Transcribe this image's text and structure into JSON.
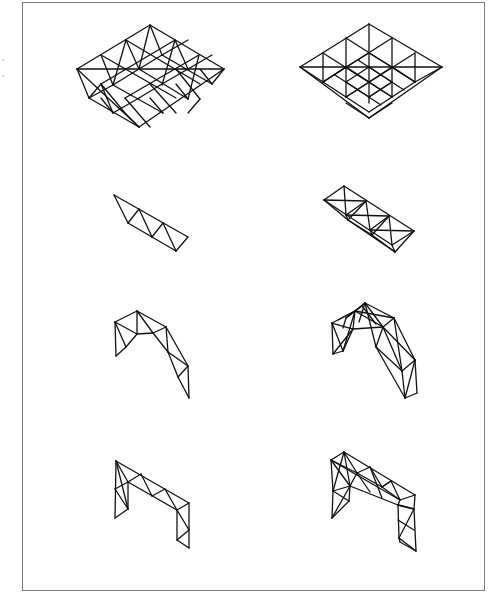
{
  "figure": {
    "background": "#ffffff",
    "frame_color": "#7a7a7a",
    "line_color": "#111111"
  },
  "structures": [
    {
      "name": "grid-plate-left",
      "label": "double-layer space grid (triangular)",
      "lines": [
        [
          150,
          25,
          77,
          69
        ],
        [
          150,
          25,
          224,
          69
        ],
        [
          77,
          69,
          139,
          127
        ],
        [
          224,
          69,
          139,
          127
        ],
        [
          77,
          69,
          224,
          69
        ],
        [
          126,
          40,
          200,
          84
        ],
        [
          101,
          55,
          176,
          98
        ],
        [
          175,
          40,
          101,
          84
        ],
        [
          199,
          55,
          125,
          98
        ],
        [
          126,
          40,
          113,
          85
        ],
        [
          150,
          25,
          139,
          69
        ],
        [
          175,
          40,
          162,
          85
        ],
        [
          199,
          55,
          188,
          99
        ],
        [
          101,
          55,
          113,
          85
        ],
        [
          126,
          40,
          139,
          69
        ],
        [
          150,
          25,
          162,
          55
        ],
        [
          175,
          40,
          188,
          69
        ],
        [
          89,
          98,
          113,
          85
        ],
        [
          113,
          85,
          139,
          69
        ],
        [
          139,
          69,
          162,
          55
        ],
        [
          162,
          55,
          188,
          40
        ],
        [
          113,
          113,
          139,
          98
        ],
        [
          139,
          98,
          162,
          84
        ],
        [
          162,
          84,
          188,
          69
        ],
        [
          188,
          69,
          212,
          55
        ],
        [
          89,
          98,
          139,
          127
        ],
        [
          113,
          85,
          163,
          113
        ],
        [
          139,
          69,
          188,
          99
        ],
        [
          162,
          55,
          212,
          84
        ],
        [
          89,
          98,
          101,
          84
        ],
        [
          113,
          113,
          101,
          98
        ],
        [
          139,
          127,
          125,
          113
        ],
        [
          163,
          113,
          150,
          98
        ],
        [
          188,
          99,
          176,
          84
        ],
        [
          212,
          84,
          200,
          69
        ],
        [
          101,
          84,
          125,
          113
        ],
        [
          125,
          98,
          150,
          127
        ],
        [
          150,
          84,
          176,
          113
        ],
        [
          176,
          69,
          200,
          99
        ],
        [
          77,
          69,
          89,
          98
        ],
        [
          224,
          69,
          212,
          84
        ],
        [
          101,
          84,
          113,
          113
        ],
        [
          200,
          99,
          188,
          113
        ]
      ]
    },
    {
      "name": "grid-plate-right",
      "label": "double-layer space grid (square-on-diagonal)",
      "lines": [
        [
          369,
          24,
          300,
          67
        ],
        [
          369,
          24,
          442,
          67
        ],
        [
          300,
          67,
          369,
          118
        ],
        [
          442,
          67,
          369,
          118
        ],
        [
          300,
          67,
          442,
          67
        ],
        [
          346,
          38,
          415,
          82
        ],
        [
          323,
          53,
          392,
          97
        ],
        [
          392,
          38,
          323,
          82
        ],
        [
          415,
          53,
          346,
          97
        ],
        [
          369,
          24,
          369,
          67
        ],
        [
          346,
          38,
          346,
          82
        ],
        [
          392,
          38,
          392,
          82
        ],
        [
          323,
          53,
          323,
          82
        ],
        [
          415,
          53,
          415,
          82
        ],
        [
          346,
          82,
          346,
          97
        ],
        [
          392,
          82,
          392,
          97
        ],
        [
          369,
          67,
          369,
          103
        ],
        [
          323,
          82,
          346,
          67
        ],
        [
          346,
          67,
          369,
          53
        ],
        [
          369,
          53,
          392,
          67
        ],
        [
          392,
          67,
          415,
          82
        ],
        [
          323,
          82,
          346,
          97
        ],
        [
          346,
          97,
          369,
          112
        ],
        [
          369,
          112,
          392,
          97
        ],
        [
          392,
          97,
          415,
          82
        ],
        [
          346,
          67,
          369,
          82
        ],
        [
          369,
          82,
          392,
          67
        ],
        [
          346,
          82,
          369,
          97
        ],
        [
          369,
          97,
          392,
          82
        ],
        [
          300,
          67,
          323,
          82
        ],
        [
          442,
          67,
          415,
          82
        ],
        [
          369,
          118,
          346,
          103
        ],
        [
          369,
          118,
          392,
          103
        ],
        [
          323,
          82,
          346,
          67
        ],
        [
          415,
          82,
          392,
          67
        ],
        [
          346,
          67,
          369,
          82
        ],
        [
          346,
          82,
          369,
          67
        ],
        [
          369,
          82,
          392,
          97
        ],
        [
          369,
          67,
          392,
          82
        ],
        [
          346,
          97,
          369,
          82
        ],
        [
          392,
          82,
          369,
          97
        ],
        [
          335,
          75,
          358,
          90
        ],
        [
          381,
          75,
          404,
          90
        ],
        [
          358,
          60,
          381,
          75
        ],
        [
          358,
          90,
          381,
          105
        ]
      ]
    },
    {
      "name": "planar-truss-left",
      "label": "planar Warren truss",
      "lines": [
        [
          114,
          195,
          188,
          237
        ],
        [
          128,
          223,
          176,
          251
        ],
        [
          176,
          251,
          188,
          237
        ],
        [
          114,
          195,
          128,
          223
        ],
        [
          128,
          223,
          139,
          209
        ],
        [
          139,
          209,
          152,
          237
        ],
        [
          152,
          237,
          163,
          223
        ],
        [
          163,
          223,
          176,
          251
        ]
      ]
    },
    {
      "name": "box-truss-right",
      "label": "triangular box truss",
      "lines": [
        [
          344,
          186,
          324,
          200
        ],
        [
          344,
          186,
          414,
          231
        ],
        [
          324,
          200,
          392,
          245
        ],
        [
          414,
          231,
          392,
          245
        ],
        [
          344,
          186,
          346,
          215
        ],
        [
          324,
          200,
          366,
          201
        ],
        [
          366,
          201,
          346,
          215
        ],
        [
          366,
          201,
          370,
          230
        ],
        [
          346,
          215,
          389,
          216
        ],
        [
          389,
          216,
          370,
          230
        ],
        [
          389,
          216,
          392,
          245
        ],
        [
          370,
          230,
          414,
          231
        ],
        [
          324,
          200,
          348,
          220
        ],
        [
          348,
          220,
          395,
          252
        ],
        [
          392,
          245,
          395,
          252
        ],
        [
          414,
          231,
          395,
          252
        ],
        [
          346,
          215,
          348,
          220
        ],
        [
          370,
          230,
          372,
          235
        ],
        [
          348,
          220,
          372,
          235
        ],
        [
          372,
          235,
          395,
          252
        ],
        [
          348,
          220,
          366,
          201
        ],
        [
          372,
          235,
          389,
          216
        ]
      ]
    },
    {
      "name": "arch-truss-left",
      "label": "planar arch truss",
      "lines": [
        [
          115,
          322,
          137,
          311
        ],
        [
          137,
          311,
          166,
          327
        ],
        [
          166,
          327,
          188,
          366
        ],
        [
          188,
          366,
          189,
          398
        ],
        [
          115,
          322,
          116,
          356
        ],
        [
          116,
          356,
          126,
          347
        ],
        [
          126,
          347,
          137,
          334
        ],
        [
          137,
          334,
          153,
          333
        ],
        [
          153,
          333,
          166,
          327
        ],
        [
          153,
          333,
          168,
          352
        ],
        [
          168,
          352,
          178,
          377
        ],
        [
          178,
          377,
          189,
          398
        ],
        [
          115,
          322,
          126,
          347
        ],
        [
          115,
          322,
          137,
          334
        ],
        [
          137,
          311,
          137,
          334
        ],
        [
          137,
          311,
          153,
          333
        ],
        [
          166,
          327,
          168,
          352
        ],
        [
          168,
          352,
          188,
          366
        ],
        [
          188,
          366,
          178,
          377
        ]
      ]
    },
    {
      "name": "arch-truss-right",
      "label": "spatial arch truss",
      "lines": [
        [
          332,
          323,
          355,
          311
        ],
        [
          355,
          311,
          365,
          303
        ],
        [
          365,
          303,
          394,
          318
        ],
        [
          355,
          311,
          383,
          327
        ],
        [
          394,
          318,
          415,
          360
        ],
        [
          383,
          327,
          402,
          371
        ],
        [
          415,
          360,
          417,
          393
        ],
        [
          402,
          371,
          405,
          398
        ],
        [
          405,
          398,
          417,
          393
        ],
        [
          402,
          371,
          415,
          360
        ],
        [
          332,
          323,
          333,
          354
        ],
        [
          333,
          354,
          343,
          351
        ],
        [
          343,
          351,
          353,
          329
        ],
        [
          353,
          329,
          383,
          327
        ],
        [
          332,
          323,
          353,
          329
        ],
        [
          355,
          311,
          353,
          329
        ],
        [
          365,
          303,
          383,
          327
        ],
        [
          394,
          318,
          383,
          327
        ],
        [
          332,
          323,
          343,
          351
        ],
        [
          355,
          311,
          343,
          351
        ],
        [
          353,
          329,
          333,
          354
        ],
        [
          365,
          303,
          376,
          347
        ],
        [
          355,
          311,
          394,
          318
        ],
        [
          383,
          327,
          376,
          347
        ],
        [
          376,
          347,
          402,
          371
        ],
        [
          394,
          318,
          402,
          371
        ],
        [
          383,
          327,
          415,
          360
        ],
        [
          376,
          347,
          405,
          398
        ],
        [
          415,
          360,
          405,
          398
        ],
        [
          343,
          328,
          346,
          318
        ],
        [
          346,
          318,
          362,
          306
        ],
        [
          362,
          306,
          376,
          324
        ],
        [
          346,
          318,
          365,
          303
        ],
        [
          338,
          320,
          355,
          311
        ],
        [
          359,
          322,
          365,
          303
        ]
      ]
    },
    {
      "name": "portal-frame-left",
      "label": "planar portal frame truss",
      "lines": [
        [
          116,
          461,
          189,
          503
        ],
        [
          128,
          482,
          177,
          510
        ],
        [
          189,
          503,
          177,
          510
        ],
        [
          116,
          461,
          128,
          482
        ],
        [
          128,
          482,
          141,
          474
        ],
        [
          141,
          474,
          152,
          496
        ],
        [
          152,
          496,
          165,
          489
        ],
        [
          165,
          489,
          177,
          510
        ],
        [
          116,
          461,
          115,
          518
        ],
        [
          128,
          482,
          128,
          509
        ],
        [
          115,
          518,
          128,
          509
        ],
        [
          116,
          461,
          128,
          509
        ],
        [
          115,
          489,
          128,
          482
        ],
        [
          115,
          489,
          128,
          509
        ],
        [
          189,
          503,
          189,
          548
        ],
        [
          177,
          510,
          177,
          540
        ],
        [
          177,
          510,
          189,
          530
        ],
        [
          177,
          540,
          189,
          530
        ],
        [
          177,
          540,
          189,
          548
        ]
      ]
    },
    {
      "name": "portal-frame-right",
      "label": "spatial portal frame truss",
      "lines": [
        [
          331,
          460,
          344,
          452
        ],
        [
          344,
          452,
          415,
          495
        ],
        [
          331,
          460,
          400,
          500
        ],
        [
          400,
          500,
          415,
          495
        ],
        [
          331,
          460,
          357,
          473
        ],
        [
          344,
          452,
          357,
          473
        ],
        [
          357,
          473,
          370,
          467
        ],
        [
          357,
          473,
          382,
          487
        ],
        [
          370,
          467,
          382,
          487
        ],
        [
          382,
          487,
          391,
          481
        ],
        [
          382,
          487,
          400,
          500
        ],
        [
          391,
          481,
          400,
          500
        ],
        [
          350,
          486,
          398,
          505
        ],
        [
          333,
          491,
          350,
          486
        ],
        [
          398,
          505,
          414,
          509
        ],
        [
          331,
          460,
          333,
          491
        ],
        [
          344,
          452,
          350,
          486
        ],
        [
          331,
          460,
          350,
          486
        ],
        [
          344,
          452,
          333,
          491
        ],
        [
          350,
          486,
          357,
          473
        ],
        [
          357,
          473,
          370,
          492
        ],
        [
          370,
          467,
          382,
          498
        ],
        [
          382,
          487,
          391,
          481
        ],
        [
          333,
          491,
          332,
          518
        ],
        [
          350,
          486,
          349,
          501
        ],
        [
          332,
          518,
          349,
          501
        ],
        [
          333,
          491,
          349,
          501
        ],
        [
          332,
          518,
          350,
          486
        ],
        [
          400,
          500,
          398,
          505
        ],
        [
          415,
          495,
          414,
          509
        ],
        [
          398,
          505,
          399,
          538
        ],
        [
          414,
          509,
          416,
          551
        ],
        [
          399,
          538,
          416,
          551
        ],
        [
          398,
          505,
          414,
          509
        ],
        [
          399,
          538,
          414,
          509
        ],
        [
          398,
          520,
          414,
          530
        ],
        [
          400,
          542,
          416,
          551
        ],
        [
          399,
          538,
          400,
          542
        ]
      ]
    }
  ],
  "specks": [
    {
      "x": 3,
      "y": 60
    },
    {
      "x": 3,
      "y": 76
    }
  ]
}
